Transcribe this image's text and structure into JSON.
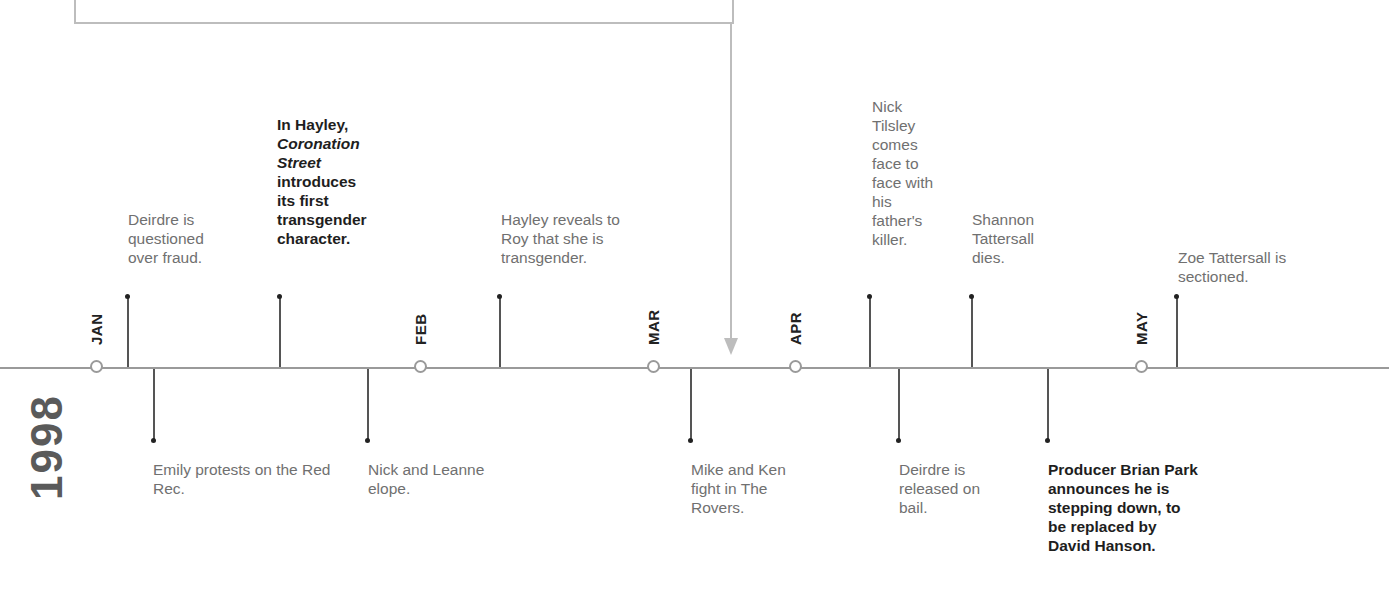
{
  "year": "1998",
  "colors": {
    "axis": "#9a9a9a",
    "stem": "#555555",
    "event_text": "#707070",
    "highlight_text": "#1e1e1e",
    "connector": "#bdbdbd"
  },
  "months": [
    {
      "label": "JAN",
      "x": 96
    },
    {
      "label": "FEB",
      "x": 420
    },
    {
      "label": "MAR",
      "x": 653
    },
    {
      "label": "APR",
      "x": 795
    },
    {
      "label": "MAY",
      "x": 1141
    }
  ],
  "events_above": [
    {
      "x": 128,
      "text": "Deirdre is questioned over fraud.",
      "bold": false
    },
    {
      "x": 280,
      "text_parts": [
        "In Hayley, ",
        "Coronation Street",
        " introduces its first transgender character."
      ],
      "bold": true
    },
    {
      "x": 500,
      "text": "Hayley reveals to Roy that she is transgender.",
      "bold": false
    },
    {
      "x": 870,
      "text": "Nick Tilsley comes face to face with his father's killer.",
      "bold": false
    },
    {
      "x": 972,
      "text": "Shannon Tattersall dies.",
      "bold": false
    },
    {
      "x": 1177,
      "text": "Zoe Tattersall is sectioned.",
      "bold": false
    }
  ],
  "events_below": [
    {
      "x": 154,
      "text": "Emily protests on the Red Rec.",
      "bold": false
    },
    {
      "x": 368,
      "text": "Nick and Leanne elope.",
      "bold": false
    },
    {
      "x": 691,
      "text": "Mike and Ken fight in The Rovers.",
      "bold": false
    },
    {
      "x": 899,
      "text": "Deirdre is released on bail.",
      "bold": false
    },
    {
      "x": 1048,
      "text": "Producer Brian Park announces he is stepping down, to be replaced by David Hanson.",
      "bold": true
    }
  ]
}
